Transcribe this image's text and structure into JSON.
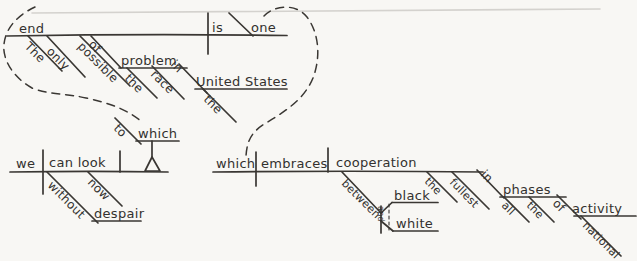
{
  "colors": {
    "ink": "#3a3733",
    "paper": "#f8f7f4",
    "faint_rule": "#d4d2ce"
  },
  "main_clause": {
    "subject": "end",
    "subject_det": "The",
    "subject_adv": "only",
    "subject_adj": "possible",
    "verb": "is",
    "predicate_noun": "one",
    "prep_of": "of",
    "of_object": "problem",
    "of_object_det": "the",
    "of_object_mod": "race",
    "prep_in": "in",
    "in_object": "United States",
    "in_object_det": "the"
  },
  "to_which_clause": {
    "prep": "to",
    "prep_object": "which",
    "subject": "we",
    "verb": "can look",
    "adverb": "now",
    "prep_without": "without",
    "without_object": "despair"
  },
  "embraces_clause": {
    "subject": "which",
    "verb": "embraces",
    "direct_object": "cooperation",
    "object_det": "the",
    "object_adj": "fullest",
    "prep_between": "between",
    "between_object_1": "black",
    "conjunction": "and",
    "between_object_2": "white",
    "prep_in": "in",
    "in_object": "phases",
    "in_object_det_1": "all",
    "in_object_det_2": "the",
    "prep_of": "of",
    "of_object": "activity",
    "of_object_mod": "national"
  }
}
